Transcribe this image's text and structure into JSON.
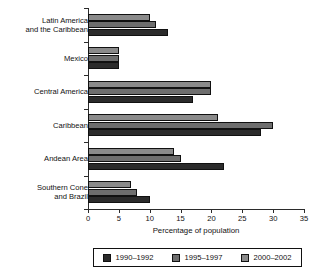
{
  "chart_data": {
    "type": "bar",
    "orientation": "horizontal",
    "title": "",
    "xlabel": "Percentage of population",
    "ylabel": "",
    "xlim": [
      0,
      35
    ],
    "xticks": [
      0,
      5,
      10,
      15,
      20,
      25,
      30,
      35
    ],
    "grid": false,
    "legend_position": "bottom",
    "categories": [
      "Latin America and the Caribbean",
      "Mexico",
      "Central America",
      "Caribbean",
      "Andean Area",
      "Southern Cone and Brazil"
    ],
    "category_lines": [
      [
        "Latin America",
        "and the Caribbean"
      ],
      [
        "Mexico"
      ],
      [
        "Central America"
      ],
      [
        "Caribbean"
      ],
      [
        "Andean Area"
      ],
      [
        "Southern Cone",
        "and Brazil"
      ]
    ],
    "series": [
      {
        "name": "1990–1992",
        "color": "#2b2b2b",
        "values": [
          13,
          5,
          17,
          28,
          22,
          10
        ]
      },
      {
        "name": "1995–1997",
        "color": "#6e6e6e",
        "values": [
          11,
          5,
          20,
          30,
          15,
          8
        ]
      },
      {
        "name": "2000–2002",
        "color": "#8a8a8a",
        "values": [
          10,
          5,
          20,
          21,
          14,
          7
        ]
      }
    ]
  },
  "legend": {
    "entries": [
      {
        "label": "1990–1992",
        "color": "#2b2b2b"
      },
      {
        "label": "1995–1997",
        "color": "#6e6e6e"
      },
      {
        "label": "2000–2002",
        "color": "#8a8a8a"
      }
    ]
  }
}
